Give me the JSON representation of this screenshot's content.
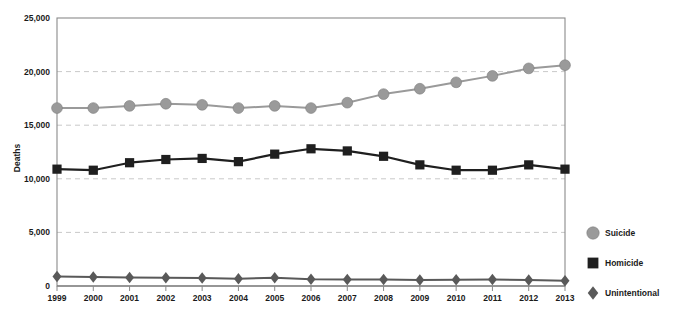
{
  "chart_data": {
    "type": "line",
    "title": "",
    "xlabel": "",
    "ylabel": "Deaths",
    "categories": [
      "1999",
      "2000",
      "2001",
      "2002",
      "2003",
      "2004",
      "2005",
      "2006",
      "2007",
      "2008",
      "2009",
      "2010",
      "2011",
      "2012",
      "2013"
    ],
    "x": [
      1999,
      2000,
      2001,
      2002,
      2003,
      2004,
      2005,
      2006,
      2007,
      2008,
      2009,
      2010,
      2011,
      2012,
      2013
    ],
    "ylim": [
      0,
      25000
    ],
    "xlim": [
      1999,
      2013
    ],
    "yticks": [
      0,
      5000,
      10000,
      15000,
      20000,
      25000
    ],
    "ytick_labels": [
      "0",
      "5,000",
      "10,000",
      "15,000",
      "20,000",
      "25,000"
    ],
    "grid": true,
    "grid_axis": "y",
    "legend_position": "right",
    "series": [
      {
        "name": "Suicide",
        "marker": "circle",
        "color": "#9a9a9a",
        "line_color": "#9a9a9a",
        "values": [
          16600,
          16600,
          16800,
          17000,
          16900,
          16600,
          16800,
          16600,
          17100,
          17900,
          18400,
          19000,
          19600,
          20300,
          20600
        ]
      },
      {
        "name": "Homicide",
        "marker": "square",
        "color": "#1f1f1f",
        "line_color": "#1f1f1f",
        "values": [
          10900,
          10800,
          11500,
          11800,
          11900,
          11600,
          12300,
          12800,
          12600,
          12100,
          11300,
          10800,
          10800,
          11300,
          10900
        ]
      },
      {
        "name": "Unintentional",
        "marker": "diamond",
        "color": "#595959",
        "line_color": "#595959",
        "values": [
          880,
          840,
          800,
          780,
          740,
          680,
          760,
          640,
          610,
          600,
          570,
          580,
          600,
          560,
          500
        ]
      }
    ]
  },
  "legend": {
    "items": [
      {
        "label": "Suicide"
      },
      {
        "label": "Homicide"
      },
      {
        "label": "Unintentional"
      }
    ]
  }
}
